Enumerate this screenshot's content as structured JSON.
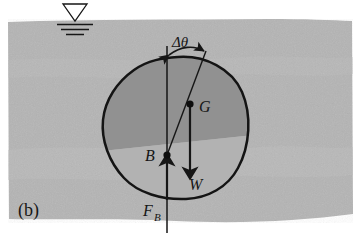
{
  "figure": {
    "panel_label": "(b)",
    "caption_hidden": "",
    "labels": {
      "tilt_angle": "Δθ",
      "center_of_gravity": "G",
      "center_of_buoyancy": "B",
      "weight": "W",
      "buoyant_force_main": "F",
      "buoyant_force_sub": "B"
    },
    "colors": {
      "water": "#b4b4b4",
      "water_light": "#bdbdbd",
      "submerged_wedge": "#8f8f8f",
      "body_fill": "#b2b2b2",
      "ink": "#161616",
      "page": "#ffffff"
    },
    "geometry": {
      "free_surface_y": 21,
      "water_bottom_y": 220,
      "body_center": [
        178,
        130
      ],
      "point_G": [
        190,
        104
      ],
      "point_B": [
        167,
        155
      ],
      "tilt_degrees": 20
    },
    "icons": {
      "free_surface": "water-surface-symbol",
      "weight_arrow": "down-arrow",
      "buoyancy_arrow": "up-arrow",
      "angle_arrow": "double-headed-arc-arrow"
    }
  }
}
